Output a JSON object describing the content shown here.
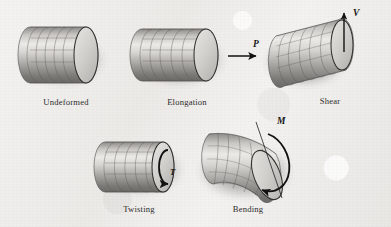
{
  "figure": {
    "background_color": "#f0efec",
    "ink_color": "#1a1a1a",
    "body_fill_light": "#e6e4e1",
    "body_fill_dark": "#6e6c69",
    "cap_fill": "#cfcdc9",
    "shadow_color": "#5a5a5a"
  },
  "panels": [
    {
      "id": "undeformed",
      "label": "Undeformed",
      "load_symbol": "",
      "load_kind": "none",
      "description": "Straight cylinder with gridded surface and elliptical end cap"
    },
    {
      "id": "elongation",
      "label": "Elongation",
      "load_symbol": "P",
      "load_kind": "axial-force-arrow",
      "arrow_direction": "right",
      "description": "Cylinder stretched by axial force P"
    },
    {
      "id": "shear",
      "label": "Shear",
      "load_symbol": "V",
      "load_kind": "transverse-force-arrow",
      "arrow_direction": "up",
      "description": "Cylinder sheared by transverse force V"
    },
    {
      "id": "twisting",
      "label": "Twisting",
      "load_symbol": "T",
      "load_kind": "torque-circular-arrow",
      "arrow_direction": "counterclockwise",
      "description": "Cylinder twisted by torque T"
    },
    {
      "id": "bending",
      "label": "Bending",
      "load_symbol": "M",
      "load_kind": "moment-curved-arrow",
      "arrow_direction": "about-transverse-axis",
      "description": "Cylinder bent by moment M about a transverse axis"
    }
  ],
  "labels": {
    "undeformed": "Undeformed",
    "elongation": "Elongation",
    "shear": "Shear",
    "twisting": "Twisting",
    "bending": "Bending"
  },
  "load_symbols": {
    "axial_force": "P",
    "shear_force": "V",
    "torque": "T",
    "moment": "M"
  }
}
